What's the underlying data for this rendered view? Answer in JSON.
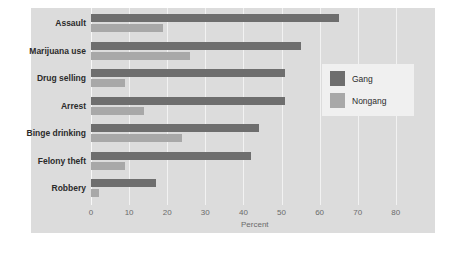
{
  "chart_data": {
    "type": "bar",
    "orientation": "horizontal",
    "title": "",
    "xlabel": "Percent",
    "ylabel": "",
    "xlim": [
      0,
      85
    ],
    "xticks": [
      0,
      10,
      20,
      30,
      40,
      50,
      60,
      70,
      80
    ],
    "xtick_labels": [
      "0",
      "10",
      "20",
      "30",
      "40",
      "50",
      "60",
      "70",
      "80"
    ],
    "grid": true,
    "legend_position": "right",
    "categories": [
      "Assault",
      "Marijuana use",
      "Drug selling",
      "Arrest",
      "Binge drinking",
      "Felony theft",
      "Robbery"
    ],
    "series": [
      {
        "name": "Gang",
        "color": "#6e6e6e",
        "values": [
          65,
          55,
          51,
          51,
          44,
          42,
          17
        ]
      },
      {
        "name": "Nongang",
        "color": "#a8a8a8",
        "values": [
          19,
          26,
          9,
          14,
          24,
          9,
          2
        ]
      }
    ]
  },
  "legend": {
    "items": [
      {
        "label": "Gang",
        "color": "#6e6e6e"
      },
      {
        "label": "Nongang",
        "color": "#a8a8a8"
      }
    ]
  },
  "colors": {
    "gang": "#6e6e6e",
    "nongang": "#a8a8a8",
    "panel": "#dcdcdc",
    "gridline": "#f2f2f2",
    "legend_background": "#f0f0f0",
    "text": "#2b2b2b",
    "tick_text": "#6b6b6b"
  }
}
